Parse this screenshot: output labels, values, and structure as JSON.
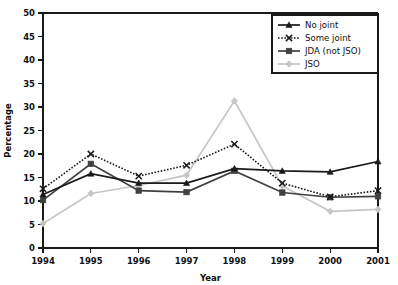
{
  "chart_data": {
    "type": "line",
    "title": "",
    "xlabel": "Year",
    "ylabel": "Percentage",
    "categories": [
      "1994",
      "1995",
      "1996",
      "1997",
      "1998",
      "1999",
      "2000",
      "2001"
    ],
    "x": [
      1994,
      1995,
      1996,
      1997,
      1998,
      1999,
      2000,
      2001
    ],
    "xlim": [
      1994,
      2001
    ],
    "ylim": [
      0,
      50
    ],
    "yticks": [
      0,
      5,
      10,
      15,
      20,
      25,
      30,
      35,
      40,
      45,
      50
    ],
    "ytick_labels": [
      "0",
      "5",
      "10",
      "15",
      "20",
      "25",
      "30",
      "35",
      "40",
      "45",
      "50"
    ],
    "grid": false,
    "legend_position": "top-right",
    "series": [
      {
        "name": "No joint",
        "values": [
          11.4,
          15.8,
          13.8,
          13.8,
          16.9,
          16.4,
          16.2,
          18.4
        ],
        "color": "#1a1a1a",
        "marker": "triangle",
        "line_style": "solid"
      },
      {
        "name": "Some joint",
        "values": [
          12.6,
          20.0,
          15.3,
          17.6,
          22.1,
          13.8,
          10.9,
          12.2
        ],
        "color": "#1a1a1a",
        "marker": "x",
        "line_style": "dotted"
      },
      {
        "name": "JDA (not JSO)",
        "values": [
          10.2,
          17.9,
          12.2,
          11.9,
          16.4,
          11.8,
          10.8,
          11.0
        ],
        "color": "#404040",
        "marker": "square",
        "line_style": "solid"
      },
      {
        "name": "JSO",
        "values": [
          5.2,
          11.6,
          13.3,
          15.5,
          31.3,
          13.2,
          7.8,
          8.2
        ],
        "color": "#c6c6c6",
        "marker": "diamond",
        "line_style": "solid"
      }
    ]
  },
  "legend": {
    "entries": [
      "No joint",
      "Some joint",
      "JDA (not JSO)",
      "JSO"
    ]
  },
  "axes": {
    "y_title": "Percentage",
    "x_title": "Year"
  }
}
